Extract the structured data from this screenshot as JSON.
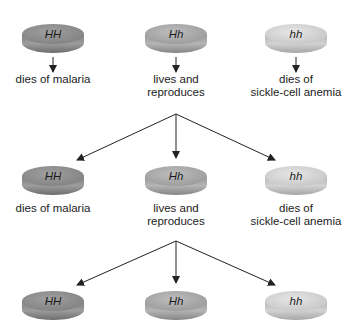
{
  "genotypes": {
    "HH": {
      "label": "HH",
      "color_top": "#8f8f8f",
      "color_side": "#8a8a8a"
    },
    "Hh": {
      "label": "Hh",
      "color_top": "#a9a9a9",
      "color_side": "#a0a0a0"
    },
    "hh": {
      "label": "hh",
      "color_top": "#d3d3d3",
      "color_side": "#bdbdbd"
    }
  },
  "rows": [
    {
      "individuals": [
        {
          "genotype": "HH",
          "outcome": [
            "dies of malaria"
          ]
        },
        {
          "genotype": "Hh",
          "outcome": [
            "lives and",
            "reproduces"
          ]
        },
        {
          "genotype": "hh",
          "outcome": [
            "dies of",
            "sickle-cell anemia"
          ]
        }
      ]
    },
    {
      "individuals": [
        {
          "genotype": "HH",
          "outcome": [
            "dies of malaria"
          ]
        },
        {
          "genotype": "Hh",
          "outcome": [
            "lives and",
            "reproduces"
          ]
        },
        {
          "genotype": "hh",
          "outcome": [
            "dies of",
            "sickle-cell anemia"
          ]
        }
      ]
    },
    {
      "individuals": [
        {
          "genotype": "HH",
          "outcome": []
        },
        {
          "genotype": "Hh",
          "outcome": []
        },
        {
          "genotype": "hh",
          "outcome": []
        }
      ]
    }
  ],
  "arrow_color": "#222222"
}
